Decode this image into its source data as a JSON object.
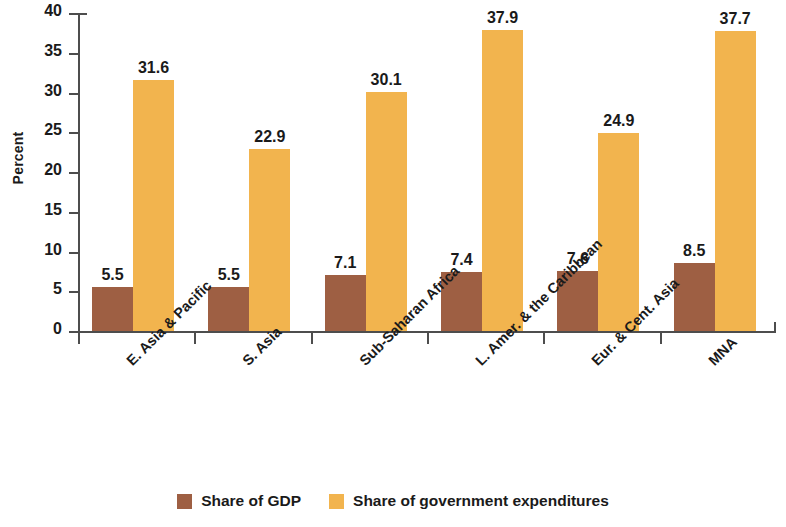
{
  "chart_data": {
    "type": "bar",
    "title": "",
    "xlabel": "",
    "ylabel": "Percent",
    "ylim": [
      0,
      40
    ],
    "yticks": [
      0,
      5,
      10,
      15,
      20,
      25,
      30,
      35,
      40
    ],
    "ytick_labels": [
      "0",
      "5",
      "10",
      "15",
      "20",
      "25",
      "30",
      "35",
      "40"
    ],
    "grid": false,
    "legend_position": "bottom-center",
    "categories": [
      "E. Asia & Pacific",
      "S. Asia",
      "Sub-Saharan Africa",
      "L. Amer. & the Caribbean",
      "Eur. & Cent. Asia",
      "MNA"
    ],
    "series": [
      {
        "name": "Share of GDP",
        "color": "#9e5f43",
        "values": [
          5.5,
          5.5,
          7.1,
          7.4,
          7.6,
          8.5
        ],
        "labels": [
          "5.5",
          "5.5",
          "7.1",
          "7.4",
          "7.6",
          "8.5"
        ]
      },
      {
        "name": "Share of government expenditures",
        "color": "#f2b44e",
        "values": [
          31.6,
          22.9,
          30.1,
          37.9,
          24.9,
          37.7
        ],
        "labels": [
          "31.6",
          "22.9",
          "30.1",
          "37.9",
          "24.9",
          "37.7"
        ]
      }
    ]
  },
  "legend": {
    "items": [
      {
        "label": "Share of GDP",
        "color": "#9e5f43"
      },
      {
        "label": "Share of government expenditures",
        "color": "#f2b44e"
      }
    ]
  },
  "axes": {
    "y_title": "Percent",
    "axis_color": "#4d4d4d"
  }
}
